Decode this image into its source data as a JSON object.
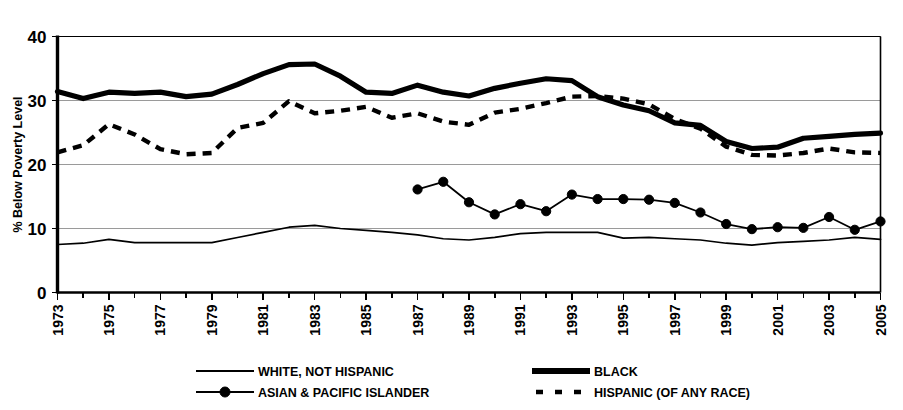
{
  "top_partial_text": "",
  "chart_data": {
    "type": "line",
    "title": "",
    "xlabel": "",
    "ylabel": "% Below Poverty Level",
    "ylim": [
      0,
      40
    ],
    "yticks": [
      0,
      10,
      20,
      30,
      40
    ],
    "ytick_labels": [
      "0",
      "10",
      "20",
      "30",
      "40"
    ],
    "grid": true,
    "grid_axis": "y",
    "legend_position": "bottom",
    "xlim": [
      1973,
      2005
    ],
    "x": [
      1973,
      1974,
      1975,
      1976,
      1977,
      1978,
      1979,
      1980,
      1981,
      1982,
      1983,
      1984,
      1985,
      1986,
      1987,
      1988,
      1989,
      1990,
      1991,
      1992,
      1993,
      1994,
      1995,
      1996,
      1997,
      1998,
      1999,
      2000,
      2001,
      2002,
      2003,
      2004,
      2005
    ],
    "xtick_labels": [
      "1973",
      "1975",
      "1977",
      "1979",
      "1981",
      "1983",
      "1985",
      "1987",
      "1989",
      "1991",
      "1993",
      "1995",
      "1997",
      "1999",
      "2001",
      "2003",
      "2005"
    ],
    "xticks_shown": [
      1973,
      1975,
      1977,
      1979,
      1981,
      1983,
      1985,
      1987,
      1989,
      1991,
      1993,
      1995,
      1997,
      1999,
      2001,
      2003,
      2005
    ],
    "series": [
      {
        "name": "WHITE, NOT HISPANIC",
        "style": "solid-thin",
        "marker": "none",
        "color": "#000000",
        "x": [
          1973,
          1974,
          1975,
          1976,
          1977,
          1978,
          1979,
          1980,
          1981,
          1982,
          1983,
          1984,
          1985,
          1986,
          1987,
          1988,
          1989,
          1990,
          1991,
          1992,
          1993,
          1994,
          1995,
          1996,
          1997,
          1998,
          1999,
          2000,
          2001,
          2002,
          2003,
          2004,
          2005
        ],
        "values": [
          7.5,
          7.7,
          8.3,
          7.8,
          7.8,
          7.8,
          7.8,
          8.6,
          9.4,
          10.2,
          10.5,
          10.0,
          9.7,
          9.4,
          9.0,
          8.4,
          8.2,
          8.6,
          9.2,
          9.4,
          9.4,
          9.4,
          8.5,
          8.6,
          8.4,
          8.2,
          7.7,
          7.4,
          7.8,
          8.0,
          8.2,
          8.6,
          8.3
        ]
      },
      {
        "name": "BLACK",
        "style": "solid-thick",
        "marker": "none",
        "color": "#000000",
        "x": [
          1973,
          1974,
          1975,
          1976,
          1977,
          1978,
          1979,
          1980,
          1981,
          1982,
          1983,
          1984,
          1985,
          1986,
          1987,
          1988,
          1989,
          1990,
          1991,
          1992,
          1993,
          1994,
          1995,
          1996,
          1997,
          1998,
          1999,
          2000,
          2001,
          2002,
          2003,
          2004,
          2005
        ],
        "values": [
          31.4,
          30.3,
          31.3,
          31.1,
          31.3,
          30.6,
          31.0,
          32.5,
          34.2,
          35.6,
          35.7,
          33.8,
          31.3,
          31.1,
          32.4,
          31.3,
          30.7,
          31.9,
          32.7,
          33.4,
          33.1,
          30.6,
          29.3,
          28.4,
          26.5,
          26.1,
          23.6,
          22.5,
          22.7,
          24.1,
          24.4,
          24.7,
          24.9
        ]
      },
      {
        "name": "ASIAN & PACIFIC ISLANDER",
        "style": "solid-thin-marker",
        "marker": "filled-circle",
        "color": "#000000",
        "x": [
          1987,
          1988,
          1989,
          1990,
          1991,
          1992,
          1993,
          1994,
          1995,
          1996,
          1997,
          1998,
          1999,
          2000,
          2001,
          2002,
          2003,
          2004,
          2005
        ],
        "values": [
          16.1,
          17.3,
          14.1,
          12.2,
          13.8,
          12.7,
          15.3,
          14.6,
          14.6,
          14.5,
          14.0,
          12.5,
          10.7,
          9.9,
          10.2,
          10.1,
          11.8,
          9.8,
          11.1
        ]
      },
      {
        "name": "HISPANIC (OF ANY RACE)",
        "style": "dashed-thick",
        "marker": "none",
        "color": "#000000",
        "x": [
          1973,
          1974,
          1975,
          1976,
          1977,
          1978,
          1979,
          1980,
          1981,
          1982,
          1983,
          1984,
          1985,
          1986,
          1987,
          1988,
          1989,
          1990,
          1991,
          1992,
          1993,
          1994,
          1995,
          1996,
          1997,
          1998,
          1999,
          2000,
          2001,
          2002,
          2003,
          2004,
          2005
        ],
        "values": [
          21.9,
          23.0,
          26.3,
          24.7,
          22.4,
          21.6,
          21.8,
          25.7,
          26.5,
          29.9,
          28.0,
          28.4,
          29.0,
          27.3,
          28.0,
          26.7,
          26.2,
          28.1,
          28.7,
          29.6,
          30.6,
          30.7,
          30.3,
          29.4,
          27.1,
          25.6,
          22.8,
          21.5,
          21.4,
          21.8,
          22.5,
          21.9,
          21.8
        ]
      }
    ]
  },
  "legend": {
    "entries": [
      {
        "label": "WHITE, NOT HISPANIC",
        "style": "solid-thin"
      },
      {
        "label": "BLACK",
        "style": "solid-thick"
      },
      {
        "label": "ASIAN & PACIFIC ISLANDER",
        "style": "solid-thin-marker"
      },
      {
        "label": "HISPANIC (OF ANY RACE)",
        "style": "dashed-thick"
      }
    ]
  }
}
